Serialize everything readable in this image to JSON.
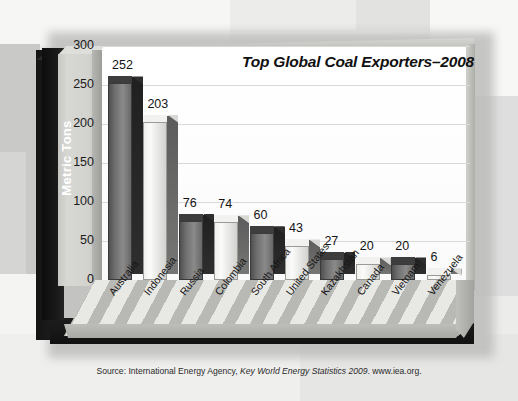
{
  "chart_data": {
    "type": "bar",
    "title": "Top Global Coal Exporters–2008",
    "xlabel": "",
    "ylabel": "Metric Tons",
    "ylim": [
      0,
      300
    ],
    "yticks": [
      300,
      250,
      200,
      150,
      100,
      50,
      0
    ],
    "grid": true,
    "legend": "none",
    "style": "3d-bar",
    "categories": [
      "Australia",
      "Indonesia",
      "Russia",
      "Colombia",
      "South Africa",
      "United States",
      "Kazakhstan",
      "Canada",
      "Vietnam",
      "Venezuela"
    ],
    "values": [
      252,
      203,
      76,
      74,
      60,
      43,
      27,
      20,
      20,
      6
    ],
    "bar_shades": [
      "dark",
      "light",
      "dark",
      "light",
      "dark",
      "light",
      "dark",
      "light",
      "dark",
      "light"
    ],
    "value_labels": [
      "252",
      "203",
      "76",
      "74",
      "60",
      "43",
      "27",
      "20",
      "20",
      "6"
    ]
  },
  "source": {
    "prefix": "Source: International Energy Agency, ",
    "italic": "Key World Energy Statistics 2009",
    "suffix": ". www.iea.org."
  },
  "colors": {
    "bar_dark": "#6e6e6e",
    "bar_light": "#f2f2f0",
    "axis_band": "#111111",
    "axis_text": "#ffffff",
    "plot_bg": "#ffffff",
    "gridline": "#d9d9d6",
    "floor": "#d3d3d0"
  }
}
